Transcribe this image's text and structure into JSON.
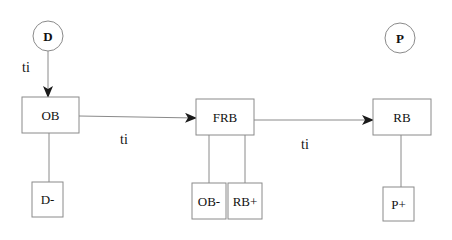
{
  "diagram": {
    "colors": {
      "stroke": "#8a8a8a",
      "arrow": "#1a1a1a",
      "text": "#111111",
      "background": "#ffffff"
    },
    "circles": [
      {
        "id": "D",
        "label": "D"
      },
      {
        "id": "P",
        "label": "P"
      }
    ],
    "boxes": [
      {
        "id": "OB",
        "label": "OB"
      },
      {
        "id": "FRB",
        "label": "FRB"
      },
      {
        "id": "RB",
        "label": "RB"
      },
      {
        "id": "D-",
        "label": "D-"
      },
      {
        "id": "OB-",
        "label": "OB-"
      },
      {
        "id": "RB+",
        "label": "RB+"
      },
      {
        "id": "P+",
        "label": "P+"
      }
    ],
    "edges": [
      {
        "from": "D",
        "to": "OB",
        "label": "ti",
        "type": "arrow"
      },
      {
        "from": "OB",
        "to": "FRB",
        "label": "ti",
        "type": "arrow"
      },
      {
        "from": "FRB",
        "to": "RB",
        "label": "ti",
        "type": "arrow"
      },
      {
        "from": "OB",
        "to": "D-",
        "label": "",
        "type": "line"
      },
      {
        "from": "FRB",
        "to": "OB-",
        "label": "",
        "type": "line"
      },
      {
        "from": "FRB",
        "to": "RB+",
        "label": "",
        "type": "line"
      },
      {
        "from": "RB",
        "to": "P+",
        "label": "",
        "type": "line"
      }
    ]
  }
}
